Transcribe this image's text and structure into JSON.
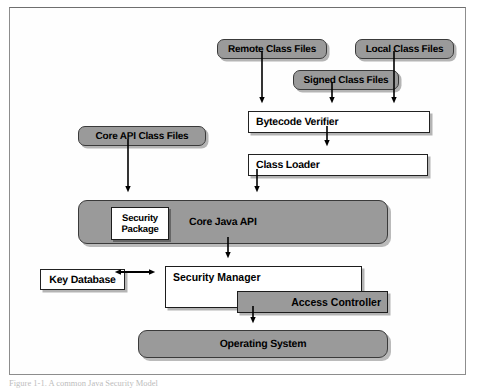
{
  "figure": {
    "caption": "Figure 1-1. A common Java Security Model",
    "colors": {
      "node_gray": "#9a9a9a",
      "node_white": "#ffffff",
      "border": "#1c1c1c",
      "frame": "#8d8d8d",
      "arrow": "#000000"
    }
  },
  "nodes": {
    "remote_class_files": "Remote Class Files",
    "local_class_files": "Local Class Files",
    "signed_class_files": "Signed Class Files",
    "core_api_class_files": "Core API Class Files",
    "bytecode_verifier": "Bytecode Verifier",
    "class_loader": "Class Loader",
    "core_java_api": "Core Java API",
    "security_package_line1": "Security",
    "security_package_line2": "Package",
    "key_database": "Key Database",
    "security_manager": "Security Manager",
    "access_controller": "Access Controller",
    "operating_system": "Operating System"
  },
  "edges": [
    {
      "from": "remote_class_files",
      "to": "bytecode_verifier",
      "style": "arrow-down"
    },
    {
      "from": "signed_class_files",
      "to": "bytecode_verifier",
      "style": "arrow-down"
    },
    {
      "from": "local_class_files",
      "to": "bytecode_verifier",
      "style": "arrow-down"
    },
    {
      "from": "bytecode_verifier",
      "to": "class_loader",
      "style": "arrow-down"
    },
    {
      "from": "class_loader",
      "to": "core_java_api",
      "style": "arrow-down"
    },
    {
      "from": "core_api_class_files",
      "to": "core_java_api",
      "style": "arrow-down"
    },
    {
      "from": "core_java_api",
      "to": "security_manager",
      "style": "arrow-down"
    },
    {
      "from": "key_database",
      "to": "security_manager",
      "style": "arrow-both"
    },
    {
      "from": "access_controller",
      "to": "operating_system",
      "style": "arrow-down"
    }
  ]
}
